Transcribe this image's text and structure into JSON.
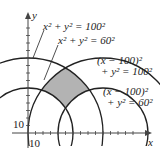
{
  "diagram": {
    "type": "circle-intersection-region",
    "axes": {
      "x_label": "x",
      "y_label": "y",
      "tick_spacing": 10,
      "x_tick_label": "10",
      "y_tick_label": "10"
    },
    "curves": [
      {
        "id": "c1",
        "equation_lhs": "x² + y² = 100²",
        "center": [
          0,
          0
        ],
        "radius": 100
      },
      {
        "id": "c2",
        "equation_lhs": "x² + y² = 60²",
        "center": [
          0,
          0
        ],
        "radius": 60
      },
      {
        "id": "c3",
        "line1": "(x − 100)²",
        "line2": "+ y² = 100²",
        "center": [
          100,
          0
        ],
        "radius": 100
      },
      {
        "id": "c4",
        "line1": "(x − 100)²",
        "line2": "+ y² = 60²",
        "center": [
          100,
          0
        ],
        "radius": 60
      }
    ],
    "labels": {
      "c1": "x² + y² = 100²",
      "c2": "x² + y² = 60²",
      "c3_line1": "(x − 100)²",
      "c3_line2": "+ y² = 100²",
      "c4_line1": "(x − 100)²",
      "c4_line2": "+ y² = 60²"
    },
    "shaded_region": "between radii 60 and 100 of both circles",
    "colors": {
      "stroke": "#222222",
      "shade": "#b3b3b3",
      "axis": "#444444"
    }
  }
}
